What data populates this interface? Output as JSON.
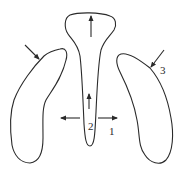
{
  "diagram": {
    "title": "",
    "shapes": [
      {
        "id": "left-lobe",
        "description": "left elongated curved lobe"
      },
      {
        "id": "center-lobe",
        "description": "central club-shaped lobe with bulbous top and tapered stem"
      },
      {
        "id": "right-lobe",
        "description": "right elongated curved lobe"
      }
    ],
    "arrows": [
      {
        "id": "center-top-up",
        "direction": "up",
        "location": "center lobe bulb"
      },
      {
        "id": "center-stem-up",
        "direction": "up",
        "location": "center lobe stem"
      },
      {
        "id": "center-left-out",
        "direction": "left",
        "location": "left of center stem"
      },
      {
        "id": "center-right-out",
        "direction": "right",
        "location": "right of center stem"
      },
      {
        "id": "left-lobe-in",
        "direction": "down-right",
        "location": "top of left lobe"
      },
      {
        "id": "right-lobe-in",
        "direction": "down-left",
        "location": "upper right of right lobe"
      }
    ],
    "labels": {
      "label_1": "1",
      "label_2": "2",
      "label_3": "3"
    },
    "colors": {
      "stroke": "#2a2a2a",
      "background": "#ffffff"
    }
  }
}
